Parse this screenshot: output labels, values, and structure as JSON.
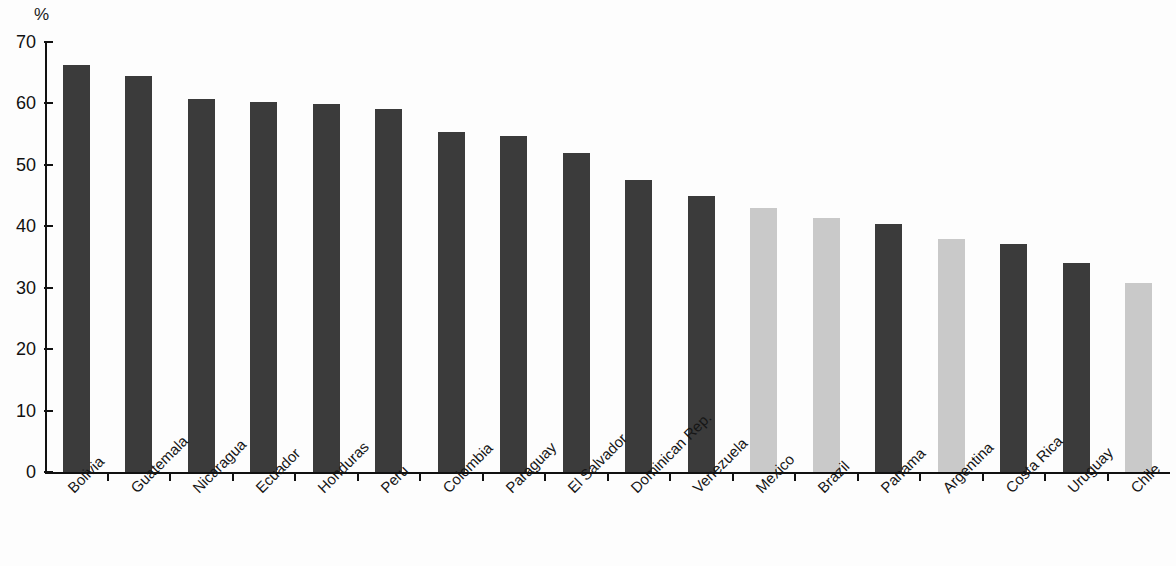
{
  "chart_data": {
    "type": "bar",
    "title": "",
    "subtitle": "",
    "xlabel": "",
    "ylabel": "",
    "unit_label": "%",
    "ylim": [
      0,
      70
    ],
    "ytick_step": 10,
    "yticks": [
      "70",
      "60",
      "50",
      "40",
      "30",
      "20",
      "10",
      "0"
    ],
    "grid": false,
    "legend": null,
    "categories": [
      "Bolivia",
      "Guatemala",
      "Nicaragua",
      "Ecuador",
      "Honduras",
      "Peru",
      "Colombia",
      "Paraguay",
      "El Salvador",
      "Dominican Rep.",
      "Venezuela",
      "Mexico",
      "Brazil",
      "Panama",
      "Argentina",
      "Costa Rica",
      "Uruguay",
      "Chile"
    ],
    "values": [
      66.3,
      64.4,
      60.7,
      60.2,
      59.9,
      59.1,
      55.3,
      54.7,
      52.0,
      47.6,
      45.0,
      42.9,
      41.3,
      40.4,
      38.0,
      37.1,
      34.1,
      30.8
    ],
    "bar_shades": [
      "dark",
      "dark",
      "dark",
      "dark",
      "dark",
      "dark",
      "dark",
      "dark",
      "dark",
      "dark",
      "dark",
      "light",
      "light",
      "dark",
      "light",
      "dark",
      "dark",
      "light"
    ]
  },
  "colors": {
    "bar_dark": "#3b3b3b",
    "bar_light": "#c9c9c9",
    "axis": "#111111",
    "background": "#fdfdfd",
    "text": "#161616"
  }
}
